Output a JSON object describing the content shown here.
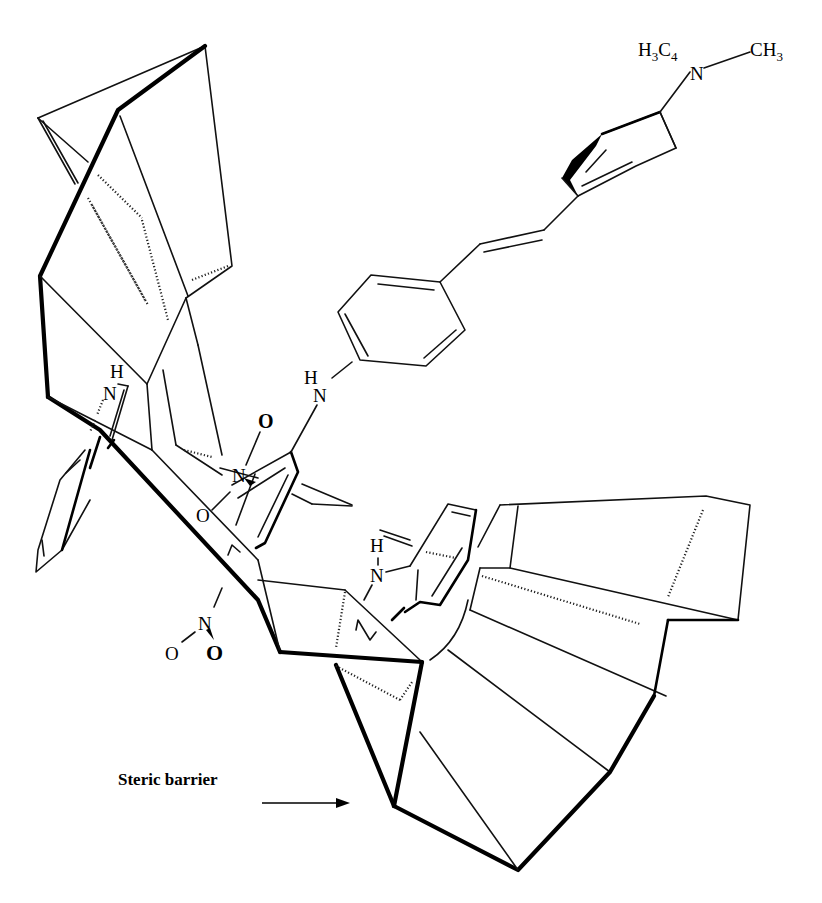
{
  "figure": {
    "type": "chemical-structure",
    "labels": {
      "top_substituent_left": "H3C4",
      "top_substituent_left_main": "H",
      "top_substituent_left_sub1": "3",
      "top_substituent_left_c": "C",
      "top_substituent_left_sub2": "4",
      "top_nitrogen": "N",
      "top_substituent_right_main": "CH",
      "top_substituent_right_sub": "3",
      "nh_upper_h": "H",
      "nh_upper_n": "N",
      "nh_left_h": "H",
      "nh_left_n": "N",
      "nh_lower_h": "H",
      "nh_lower_n": "N",
      "nitro_upper_n": "N",
      "nitro_upper_o1": "O",
      "nitro_upper_o2": "O",
      "nitro_lower_n": "N",
      "nitro_lower_o1": "O",
      "nitro_lower_o2": "O"
    },
    "annotation": {
      "text": "Steric barrier",
      "arrow": "right-arrow"
    },
    "colors": {
      "line": "#000000",
      "background": "#ffffff"
    }
  }
}
